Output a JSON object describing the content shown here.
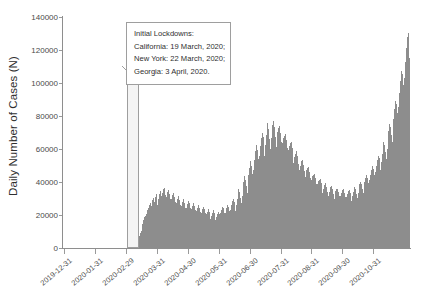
{
  "chart_data": {
    "type": "bar",
    "title": "",
    "xlabel": "",
    "ylabel": "Daily Number of Cases (N)",
    "ylim": [
      0,
      140000
    ],
    "grid": false,
    "legend": null,
    "y_ticks": [
      0,
      20000,
      40000,
      60000,
      80000,
      100000,
      120000,
      140000
    ],
    "y_tick_labels": [
      "0",
      "20000",
      "40000",
      "60000",
      "80000",
      "100000",
      "120000",
      "140000"
    ],
    "x_tick_labels": [
      "2019-12-31",
      "2020-01-31",
      "2020-02-29",
      "2020-03-31",
      "2020-04-30",
      "2020-05-31",
      "2020-06-30",
      "2020-07-31",
      "2020-08-31",
      "2020-09-30",
      "2020-10-31"
    ],
    "x_range": [
      "2019-12-31",
      "2020-11-07"
    ],
    "bar_color": "#8d8d8d",
    "series": [
      {
        "name": "Daily Number of Cases",
        "values": [
          0,
          0,
          0,
          0,
          0,
          0,
          0,
          0,
          0,
          0,
          0,
          0,
          0,
          0,
          0,
          0,
          0,
          0,
          0,
          0,
          0,
          0,
          0,
          0,
          0,
          0,
          0,
          0,
          0,
          0,
          0,
          0,
          0,
          0,
          0,
          0,
          0,
          0,
          0,
          0,
          0,
          0,
          0,
          0,
          0,
          0,
          0,
          0,
          0,
          0,
          0,
          0,
          0,
          0,
          0,
          0,
          0,
          0,
          0,
          0,
          0,
          0,
          0,
          0,
          0,
          0,
          0,
          0,
          0,
          0,
          0,
          0,
          0,
          0,
          0,
          0,
          0,
          0,
          0,
          0,
          100,
          150,
          200,
          300,
          400,
          600,
          900,
          1200,
          1700,
          2200,
          3000,
          4200,
          5400,
          7000,
          8800,
          10500,
          12100,
          14500,
          17000,
          18500,
          19200,
          20500,
          21800,
          23000,
          24500,
          26000,
          27500,
          22000,
          25500,
          29000,
          30500,
          28000,
          31000,
          32500,
          29500,
          26000,
          30000,
          33000,
          34500,
          31500,
          28500,
          33500,
          35500,
          36500,
          32000,
          27000,
          31000,
          34000,
          35000,
          33000,
          30000,
          26500,
          29500,
          32000,
          33500,
          31000,
          28000,
          24500,
          27500,
          30000,
          31500,
          29000,
          26000,
          23000,
          25500,
          28000,
          29500,
          27500,
          24500,
          22000,
          24000,
          26500,
          28500,
          27000,
          24000,
          21500,
          23500,
          25500,
          27000,
          25500,
          23000,
          20500,
          22500,
          24500,
          26000,
          24500,
          22000,
          20000,
          21500,
          23500,
          25000,
          23500,
          21000,
          19000,
          20500,
          22000,
          23500,
          22000,
          19500,
          17500,
          19500,
          21500,
          23000,
          21500,
          19000,
          17000,
          18500,
          20500,
          22000,
          20500,
          18500,
          21000,
          23000,
          25000,
          24000,
          21500,
          19000,
          21500,
          24000,
          26000,
          25000,
          22500,
          20000,
          23000,
          26000,
          28500,
          30000,
          28000,
          25000,
          22500,
          26000,
          30000,
          33000,
          35500,
          34000,
          30500,
          27500,
          31500,
          36000,
          40000,
          43500,
          41500,
          37500,
          33500,
          38500,
          44000,
          48500,
          52500,
          50000,
          45000,
          41000,
          47000,
          53500,
          58500,
          62500,
          59500,
          54000,
          49000,
          55500,
          62000,
          66500,
          70000,
          67000,
          61000,
          55500,
          62500,
          68500,
          72500,
          75500,
          72000,
          66000,
          60000,
          66500,
          71500,
          74500,
          77000,
          73500,
          67500,
          61500,
          67000,
          70500,
          72500,
          74000,
          70000,
          64500,
          59000,
          63500,
          66500,
          68000,
          69000,
          65500,
          60500,
          55500,
          59500,
          62000,
          63500,
          64000,
          60500,
          56000,
          51500,
          55000,
          57000,
          58000,
          58500,
          55500,
          51000,
          47000,
          50000,
          52000,
          53000,
          53500,
          50500,
          46500,
          43000,
          45500,
          47500,
          48500,
          49000,
          46000,
          42500,
          39000,
          41500,
          43500,
          44500,
          45000,
          42500,
          39000,
          36000,
          38500,
          40500,
          41500,
          42000,
          39500,
          36500,
          33500,
          36000,
          38000,
          39000,
          39500,
          37000,
          34000,
          31500,
          34000,
          36000,
          37000,
          37500,
          35500,
          32500,
          30000,
          32500,
          34500,
          35500,
          36000,
          34000,
          31500,
          29000,
          31500,
          33500,
          35000,
          35500,
          33500,
          31000,
          28500,
          31000,
          33000,
          34500,
          35000,
          33500,
          31000,
          28500,
          31500,
          34000,
          36000,
          37000,
          35500,
          33000,
          30500,
          33500,
          36500,
          38500,
          40000,
          38500,
          36000,
          33500,
          37000,
          40000,
          42500,
          44000,
          42500,
          39500,
          37000,
          41000,
          44500,
          47500,
          49500,
          48000,
          44500,
          41500,
          46000,
          50000,
          53500,
          56000,
          54500,
          50500,
          47000,
          52000,
          57000,
          61000,
          64000,
          62500,
          58000,
          54000,
          60000,
          66000,
          71000,
          75000,
          73500,
          68500,
          64000,
          71000,
          78000,
          84000,
          89000,
          87500,
          82000,
          77000,
          85500,
          94000,
          101000,
          107000,
          105500,
          99000,
          93000,
          103000,
          113000,
          121000,
          128000,
          130500,
          122000,
          115000
        ]
      }
    ],
    "annotation": {
      "lines": [
        "Initial Lockdowns:",
        "California: 19 March, 2020;",
        "New York: 22 March, 2020;",
        "Georgia: 3 April, 2020."
      ],
      "highlight_band": {
        "from": "2020-03-19",
        "to": "2020-04-03",
        "fill": "#f4f4f4",
        "border": "#9e9e9e"
      }
    }
  }
}
